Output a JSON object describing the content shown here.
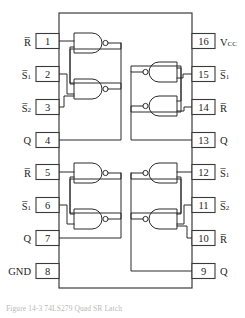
{
  "diagram": {
    "type": "ic-pinout",
    "package": "16-pin DIP",
    "pin_count": 16,
    "caption": "Figure 14-3    74LS279 Quad SR Latch"
  },
  "pins": {
    "left": [
      {
        "number": "1",
        "label": "R",
        "overline": true,
        "subscript": ""
      },
      {
        "number": "2",
        "label": "S",
        "overline": true,
        "subscript": "1"
      },
      {
        "number": "3",
        "label": "S",
        "overline": true,
        "subscript": "2"
      },
      {
        "number": "4",
        "label": "Q",
        "overline": false,
        "subscript": ""
      },
      {
        "number": "5",
        "label": "R",
        "overline": true,
        "subscript": ""
      },
      {
        "number": "6",
        "label": "S",
        "overline": true,
        "subscript": "1"
      },
      {
        "number": "7",
        "label": "Q",
        "overline": false,
        "subscript": ""
      },
      {
        "number": "8",
        "label": "GND",
        "overline": false,
        "subscript": ""
      }
    ],
    "right": [
      {
        "number": "16",
        "label": "V",
        "overline": false,
        "subscript": "CC"
      },
      {
        "number": "15",
        "label": "S",
        "overline": true,
        "subscript": "1"
      },
      {
        "number": "14",
        "label": "R",
        "overline": true,
        "subscript": ""
      },
      {
        "number": "13",
        "label": "Q",
        "overline": false,
        "subscript": ""
      },
      {
        "number": "12",
        "label": "S",
        "overline": true,
        "subscript": "1"
      },
      {
        "number": "11",
        "label": "S",
        "overline": true,
        "subscript": "2"
      },
      {
        "number": "10",
        "label": "R",
        "overline": true,
        "subscript": ""
      },
      {
        "number": "9",
        "label": "Q",
        "overline": false,
        "subscript": ""
      }
    ]
  },
  "latches": [
    {
      "name": "latch-top-left",
      "gates": 2,
      "gate_type": "NAND",
      "orientation": "left"
    },
    {
      "name": "latch-top-right",
      "gates": 2,
      "gate_type": "NAND",
      "orientation": "right"
    },
    {
      "name": "latch-bottom-left",
      "gates": 2,
      "gate_type": "NAND",
      "orientation": "left"
    },
    {
      "name": "latch-bottom-right",
      "gates": 2,
      "gate_type": "NAND",
      "orientation": "right"
    }
  ],
  "colors": {
    "line": "#2b2b2b",
    "background": "#ffffff",
    "text": "#1c1c1c",
    "caption": "#b9b9b9"
  }
}
